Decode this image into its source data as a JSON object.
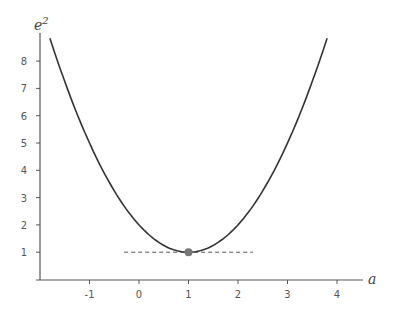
{
  "chart_data": {
    "type": "line",
    "title": "",
    "xlabel": "a",
    "ylabel": "e^2",
    "ylabel_base": "e",
    "ylabel_exp": "2",
    "xlim": [
      -2,
      4.5
    ],
    "ylim": [
      0,
      9.3
    ],
    "x_ticks": [
      -1,
      0,
      1,
      2,
      3,
      4
    ],
    "x_tick_labels": [
      "-1",
      "0",
      "1",
      "2",
      "3",
      "4"
    ],
    "y_ticks": [
      1,
      2,
      3,
      4,
      5,
      6,
      7,
      8
    ],
    "y_tick_labels": [
      "1",
      "2",
      "3",
      "4",
      "5",
      "6",
      "7",
      "8"
    ],
    "grid": false,
    "series": [
      {
        "name": "e^2 = (a-1)^2 + 1",
        "x": [
          -1.8,
          -1.5,
          -1,
          -0.5,
          0,
          0.5,
          1,
          1.5,
          2,
          2.5,
          3,
          3.5,
          3.8
        ],
        "values": [
          8.84,
          7.25,
          5,
          3.25,
          2,
          1.25,
          1,
          1.25,
          2,
          3.25,
          5,
          7.25,
          8.84
        ]
      }
    ],
    "annotations": [
      {
        "type": "point",
        "x": 1,
        "y": 1,
        "label": "minimum"
      },
      {
        "type": "dashed-hline",
        "y": 1,
        "x_from": -0.3,
        "x_to": 2.3
      }
    ]
  }
}
